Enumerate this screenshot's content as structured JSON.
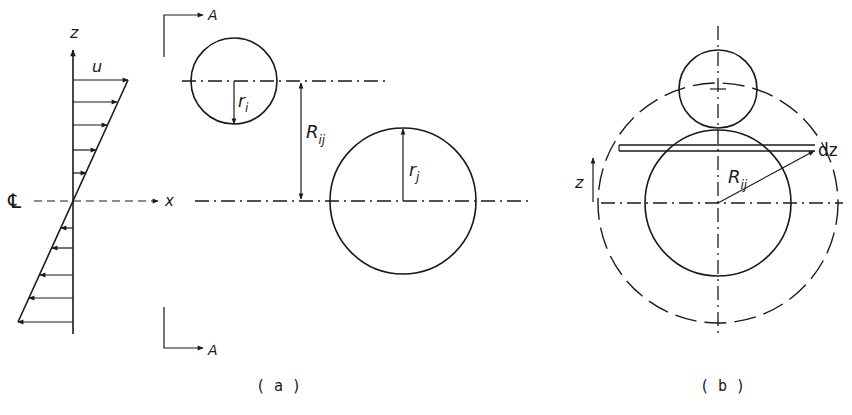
{
  "figure": {
    "panel_a": {
      "caption": "( a )",
      "velocity_profile": {
        "vertical_axis_label": "z",
        "velocity_label": "u",
        "horizontal_axis_label": "x",
        "centerline_symbol": "℄"
      },
      "section_marker_top": "A",
      "section_marker_bottom": "A",
      "particle_i_radius_label": "r",
      "particle_i_radius_subscript": "i",
      "separation_label": "R",
      "separation_subscript": "ij",
      "particle_j_radius_label": "r",
      "particle_j_radius_subscript": "j"
    },
    "panel_b": {
      "caption": "( b )",
      "vertical_axis_label": "z",
      "separation_label": "R",
      "separation_subscript": "ij",
      "slice_label": "dz"
    },
    "colors": {
      "ink": "#1a1a1a",
      "background": "#ffffff"
    }
  }
}
